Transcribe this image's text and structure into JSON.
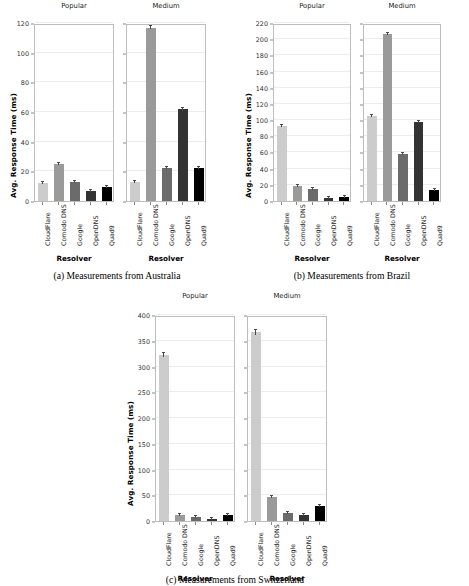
{
  "chart_data": [
    {
      "type": "bar",
      "figure_id": "a",
      "caption": "(a) Measurements from Australia",
      "xlabel": "Resolver",
      "ylabel": "Avg. Response Time (ms)",
      "categories": [
        "CloudFlare",
        "Comodo DNS",
        "Google",
        "OpenDNS",
        "Quad9"
      ],
      "ylim": [
        0,
        120
      ],
      "yticks": [
        0,
        20,
        40,
        60,
        80,
        100,
        120
      ],
      "grid": true,
      "legend": "none",
      "panels": [
        {
          "title": "Popular",
          "values": [
            12.0,
            25.5,
            12.8,
            7.0,
            9.4
          ],
          "errors": [
            0.6,
            0.7,
            0.5,
            0.4,
            0.4
          ]
        },
        {
          "title": "Medium",
          "values": [
            13.2,
            118.2,
            22.6,
            62.5,
            22.2
          ],
          "errors": [
            0.6,
            1.0,
            0.7,
            0.8,
            0.7
          ]
        }
      ]
    },
    {
      "type": "bar",
      "figure_id": "b",
      "caption": "(b) Measurements from Brazil",
      "xlabel": "Resolver",
      "ylabel": "Avg. Response Time (ms)",
      "categories": [
        "CloudFlare",
        "Comodo DNS",
        "Google",
        "OpenDNS",
        "Quad9"
      ],
      "ylim": [
        0,
        220
      ],
      "yticks": [
        0,
        20,
        40,
        60,
        80,
        100,
        120,
        140,
        160,
        180,
        200,
        220
      ],
      "grid": true,
      "legend": "none",
      "panels": [
        {
          "title": "Popular",
          "values": [
            93.5,
            18.5,
            14.5,
            4.0,
            5.0
          ],
          "errors": [
            1.0,
            0.7,
            0.6,
            0.4,
            0.4
          ]
        },
        {
          "title": "Medium",
          "values": [
            106.0,
            209.0,
            58.5,
            98.5,
            14.0
          ],
          "errors": [
            1.2,
            1.5,
            0.9,
            1.0,
            0.6
          ]
        }
      ]
    },
    {
      "type": "bar",
      "figure_id": "c",
      "caption": "(c) Measurements from Switzerland",
      "xlabel": "Resolver",
      "ylabel": "Avg. Response Time (ms)",
      "categories": [
        "CloudFlare",
        "Comodo DNS",
        "Google",
        "OpenDNS",
        "Quad9"
      ],
      "ylim": [
        0,
        400
      ],
      "yticks": [
        0,
        50,
        100,
        150,
        200,
        250,
        300,
        350,
        400
      ],
      "grid": true,
      "legend": "none",
      "panels": [
        {
          "title": "Popular",
          "values": [
            325.0,
            11.0,
            7.0,
            3.0,
            11.5
          ],
          "errors": [
            4.0,
            0.8,
            0.6,
            0.4,
            0.8
          ]
        },
        {
          "title": "Medium",
          "values": [
            370.0,
            48.0,
            15.0,
            11.0,
            30.0
          ],
          "errors": [
            5.0,
            1.2,
            0.8,
            0.7,
            1.0
          ]
        }
      ]
    }
  ],
  "bar_colors": {
    "CloudFlare": "#cccccc",
    "Comodo DNS": "#9a9a9a",
    "Google": "#6b6b6b",
    "OpenDNS": "#333333",
    "Quad9": "#000000"
  },
  "axis_color": "#bdbdbd",
  "grid_color": "#ececec"
}
